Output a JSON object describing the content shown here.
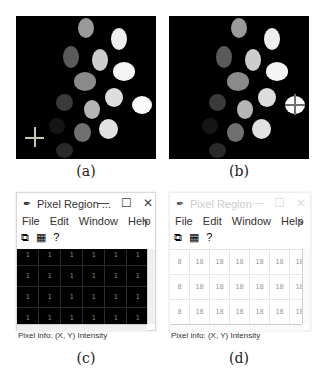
{
  "panels": [
    {
      "id": "a",
      "caption": "(a)",
      "image": {
        "description": "Grayscale labeled blobs on black background, crosshair cursor at lower-left",
        "cursor": "crosshair-icon"
      }
    },
    {
      "id": "b",
      "caption": "(b)",
      "image": {
        "description": "Same grayscale labeled blobs, crosshair cursor over bright blob at right",
        "cursor": "crosshair-icon"
      }
    },
    {
      "id": "c",
      "caption": "(c)",
      "window": {
        "title": "Pixel Region ...",
        "controls": {
          "minimize": "—",
          "maximize": "☐",
          "close": "✕"
        },
        "menu": [
          "File",
          "Edit",
          "Window",
          "Help"
        ],
        "toolbar_icons": [
          "copy-pixel-region-icon",
          "grid-icon",
          "help-icon"
        ],
        "grid_background": "#000000",
        "grid_text_color": "#8a8a6a",
        "rows": [
          [
            "1",
            "1",
            "1",
            "1",
            "1",
            "1"
          ],
          [
            "1",
            "1",
            "1",
            "1",
            "1",
            "1"
          ],
          [
            "1",
            "1",
            "1",
            "1",
            "1",
            "1"
          ],
          [
            "1",
            "1",
            "1",
            "1",
            "1",
            "1"
          ]
        ],
        "status": "Pixel info: (X, Y)  Intensity"
      }
    },
    {
      "id": "d",
      "caption": "(d)",
      "window": {
        "title": "Pixel Region",
        "controls": {
          "minimize": "—",
          "maximize": "☐",
          "close": "✕"
        },
        "menu": [
          "File",
          "Edit",
          "Window",
          "Help"
        ],
        "toolbar_icons": [
          "copy-pixel-region-icon",
          "grid-icon",
          "help-icon"
        ],
        "grid_background": "#ffffff",
        "grid_text_color": "#999999",
        "rows": [
          [
            "8",
            "18",
            "18",
            "18",
            "18",
            "18",
            "18"
          ],
          [
            "8",
            "18",
            "18",
            "18",
            "18",
            "18",
            "18"
          ],
          [
            "8",
            "18",
            "18",
            "18",
            "18",
            "18",
            "18"
          ]
        ],
        "status": "Pixel info: (X, Y)  Intensity"
      }
    }
  ]
}
